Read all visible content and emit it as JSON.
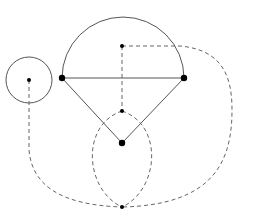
{
  "diagram": {
    "width": 261,
    "height": 218,
    "colors": {
      "background": "#ffffff",
      "solid_stroke": "#555555",
      "dashed_stroke": "#666666",
      "point_fill": "#000000"
    },
    "solid_shapes": {
      "small_circle": {
        "cx": 29,
        "cy": 80,
        "r": 23
      },
      "semicircle": {
        "cx": 123,
        "cy": 78,
        "r": 61
      },
      "diameter": {
        "x1": 62,
        "y1": 78,
        "x2": 184,
        "y2": 78
      },
      "triangle_left_side": {
        "x1": 62,
        "y1": 78,
        "x2": 122,
        "y2": 143
      },
      "triangle_right_side": {
        "x1": 184,
        "y1": 78,
        "x2": 122,
        "y2": 143
      }
    },
    "points": [
      {
        "id": "small-circle-center",
        "x": 29,
        "y": 80,
        "r": 2
      },
      {
        "id": "tangent-point",
        "x": 62,
        "y": 78,
        "r": 3.2
      },
      {
        "id": "right-endpoint",
        "x": 184,
        "y": 78,
        "r": 3.2
      },
      {
        "id": "triangle-apex",
        "x": 122,
        "y": 143,
        "r": 3.2
      },
      {
        "id": "upper-dual-point",
        "x": 122,
        "y": 46,
        "r": 2
      },
      {
        "id": "middle-dual-point",
        "x": 122,
        "y": 111,
        "r": 2
      },
      {
        "id": "bottom-dual-point",
        "x": 122,
        "y": 207,
        "r": 2
      }
    ]
  }
}
